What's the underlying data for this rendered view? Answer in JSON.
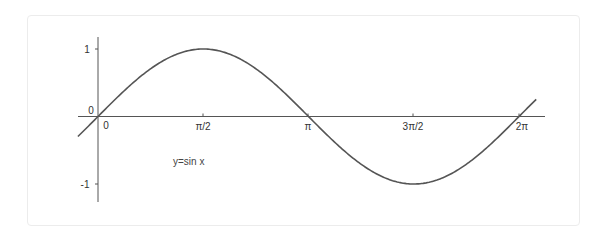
{
  "chart_data": {
    "type": "line",
    "title": "",
    "xlabel": "",
    "ylabel": "",
    "annotation": "y=sin x",
    "grid": false,
    "legend": null,
    "function": "sin",
    "xlim": [
      -0.3,
      6.54
    ],
    "ylim": [
      -1.3,
      1.2
    ],
    "x_ticks": [
      {
        "value": 0,
        "label": "0"
      },
      {
        "value": 1.5708,
        "label": "π/2"
      },
      {
        "value": 3.1416,
        "label": "π"
      },
      {
        "value": 4.7124,
        "label": "3π/2"
      },
      {
        "value": 6.2832,
        "label": "2π"
      }
    ],
    "y_ticks": [
      {
        "value": 1,
        "label": "1"
      },
      {
        "value": 0,
        "label": "0"
      },
      {
        "value": -1,
        "label": "-1"
      }
    ],
    "series": [
      {
        "name": "y=sin x",
        "x": [
          -0.3,
          0,
          0.5236,
          1.0472,
          1.5708,
          2.0944,
          2.618,
          3.1416,
          3.6652,
          4.1888,
          4.7124,
          5.236,
          5.7596,
          6.2832,
          6.54
        ],
        "values": [
          -0.296,
          0,
          0.5,
          0.866,
          1,
          0.866,
          0.5,
          0,
          -0.5,
          -0.866,
          -1,
          -0.866,
          -0.5,
          0,
          0.254
        ]
      }
    ],
    "colors": {
      "curve": "#555555",
      "axes": "#555555",
      "text": "#333333"
    }
  },
  "labels": {
    "origin_y": "0",
    "origin_x": "0",
    "tick_pi_half": "π/2",
    "tick_pi": "π",
    "tick_three_pi_half": "3π/2",
    "tick_two_pi": "2π",
    "tick_y_pos1": "1",
    "tick_y_neg1": "-1",
    "annotation": "y=sin x"
  }
}
